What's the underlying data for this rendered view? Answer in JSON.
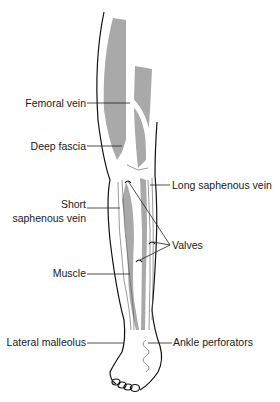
{
  "diagram": {
    "colors": {
      "muscle": "#a9a9a9",
      "outline": "#111111",
      "label": "#1a1a1a",
      "background": "#ffffff"
    },
    "labels": {
      "femoral_vein": "Femoral vein",
      "deep_fascia": "Deep fascia",
      "long_saphenous_vein": "Long saphenous vein",
      "short_line1": "Short",
      "short_line2": "saphenous vein",
      "valves": "Valves",
      "muscle": "Muscle",
      "lateral_malleolus": "Lateral malleolus",
      "ankle_perforators": "Ankle perforators"
    }
  }
}
